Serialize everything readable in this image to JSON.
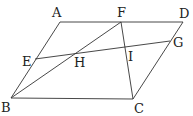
{
  "diagram": {
    "type": "geometry",
    "shape": "parallelogram ABCD",
    "points": {
      "A": {
        "label": "A",
        "x": 60,
        "y": 22
      },
      "B": {
        "label": "B",
        "x": 11,
        "y": 98
      },
      "C": {
        "label": "C",
        "x": 133,
        "y": 99
      },
      "D": {
        "label": "D",
        "x": 183,
        "y": 22
      },
      "E": {
        "label": "E",
        "x": 35,
        "y": 59
      },
      "F": {
        "label": "F",
        "x": 121,
        "y": 22
      },
      "G": {
        "label": "G",
        "x": 170,
        "y": 41
      },
      "H": {
        "label": "H",
        "x": 76,
        "y": 53
      },
      "I": {
        "label": "I",
        "x": 125,
        "y": 47
      }
    },
    "segments": [
      "AD",
      "DC",
      "CB",
      "BA",
      "BF",
      "FC",
      "EG"
    ],
    "labels": {
      "A": "A",
      "B": "B",
      "C": "C",
      "D": "D",
      "E": "E",
      "F": "F",
      "G": "G",
      "H": "H",
      "I": "I"
    }
  }
}
